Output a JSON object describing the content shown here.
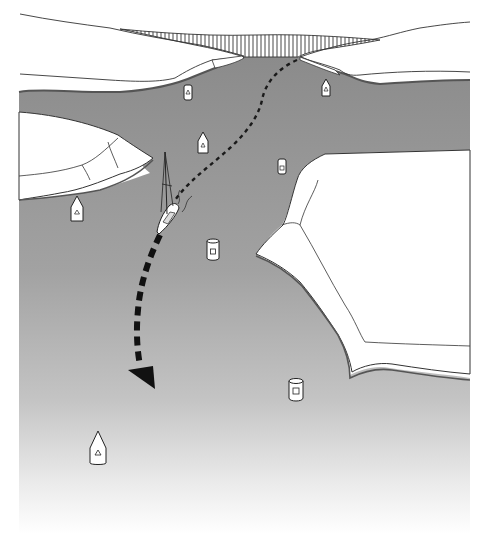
{
  "figure": {
    "colors": {
      "water_top": "#8e8e8e",
      "water_mid": "#a9a9a9",
      "water_bottom": "#ffffff",
      "land": "#ffffff",
      "outline": "#333333",
      "shore_band": "#6f6f6f",
      "course_line": "#1a1a1a"
    }
  },
  "elements": {
    "bridge": {
      "label": "bridge-hatched-structure"
    },
    "boat": {
      "label": "sailboat"
    },
    "course": {
      "label": "dashed-course-arrow"
    },
    "buoys": [
      {
        "id": "buoy-1",
        "type": "can",
        "symbol": "triangle",
        "x": 188,
        "y": 93
      },
      {
        "id": "buoy-2",
        "type": "nun",
        "symbol": "triangle",
        "x": 326,
        "y": 88
      },
      {
        "id": "buoy-3",
        "type": "nun",
        "symbol": "triangle",
        "x": 203,
        "y": 142
      },
      {
        "id": "buoy-4",
        "type": "can",
        "symbol": "square",
        "x": 282,
        "y": 167
      },
      {
        "id": "buoy-5",
        "type": "nun",
        "symbol": "triangle",
        "x": 77,
        "y": 208
      },
      {
        "id": "buoy-6",
        "type": "can",
        "symbol": "square",
        "x": 213,
        "y": 249
      },
      {
        "id": "buoy-7",
        "type": "can",
        "symbol": "square",
        "x": 296,
        "y": 389
      },
      {
        "id": "buoy-8",
        "type": "nun",
        "symbol": "triangle",
        "x": 98,
        "y": 447
      }
    ]
  }
}
